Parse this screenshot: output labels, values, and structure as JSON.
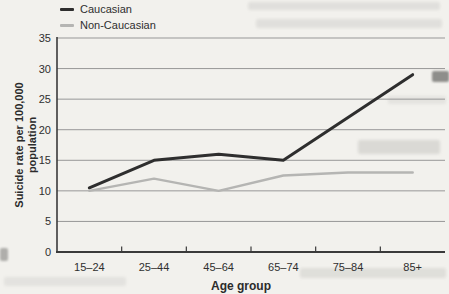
{
  "colors": {
    "background": "#f2f1ed",
    "grid": "#979797",
    "axis": "#3a3a3a",
    "text": "#2f2f2f"
  },
  "chart_data": {
    "type": "line",
    "title": "",
    "xlabel": "Age group",
    "ylabel": "Suicide rate per 100,000 population",
    "ylabel_lines": [
      "Suicide rate per 100,000",
      "population"
    ],
    "categories": [
      "15–24",
      "25–44",
      "45–64",
      "65–74",
      "75–84",
      "85+"
    ],
    "series": [
      {
        "name": "Caucasian",
        "color": "#2e2e2e",
        "width": 3,
        "values": [
          10.5,
          15,
          16,
          15,
          22,
          29
        ]
      },
      {
        "name": "Non-Caucasian",
        "color": "#b5b5b3",
        "width": 2.5,
        "values": [
          10,
          12,
          10,
          12.5,
          13,
          13
        ]
      }
    ],
    "ylim": [
      0,
      35
    ],
    "yticks": [
      0,
      5,
      10,
      15,
      20,
      25,
      30,
      35
    ],
    "grid": "horizontal",
    "legend_position": "top-left"
  }
}
